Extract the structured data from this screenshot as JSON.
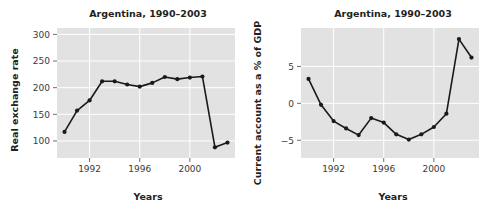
{
  "figure": {
    "title": "",
    "panels": [
      "left",
      "right"
    ]
  },
  "chart_data": [
    {
      "id": "real-exchange-rate",
      "type": "line",
      "title": "Argentina, 1990–2003",
      "xlabel": "Years",
      "ylabel": "Real exchange rate",
      "xlim": [
        1989.4,
        2003.6
      ],
      "ylim": [
        68,
        312
      ],
      "xticks": [
        1992,
        1996,
        2000
      ],
      "xticklabels": [
        "1992",
        "1996",
        "2000"
      ],
      "yticks": [
        100,
        150,
        200,
        250,
        300
      ],
      "yticklabels": [
        "100",
        "150",
        "200",
        "250",
        "300"
      ],
      "grid": true,
      "legend": "none",
      "x": [
        1990,
        1991,
        1992,
        1993,
        1994,
        1995,
        1996,
        1997,
        1998,
        1999,
        2000,
        2001,
        2002,
        2003
      ],
      "values": [
        117,
        157,
        176,
        212,
        212,
        206,
        202,
        209,
        220,
        216,
        219,
        221,
        88,
        97
      ],
      "series": [
        {
          "name": "Real exchange rate",
          "values": [
            117,
            157,
            176,
            212,
            212,
            206,
            202,
            209,
            220,
            216,
            219,
            221,
            88,
            97
          ]
        }
      ]
    },
    {
      "id": "current-account-pct-gdp",
      "type": "line",
      "title": "Argentina, 1990–2003",
      "xlabel": "Years",
      "ylabel": "Current account as a % of GDP",
      "xlim": [
        1989.4,
        2003.6
      ],
      "ylim": [
        -7.4,
        10.2
      ],
      "xticks": [
        1992,
        1996,
        2000
      ],
      "xticklabels": [
        "1992",
        "1996",
        "2000"
      ],
      "yticks": [
        -5,
        0,
        5
      ],
      "yticklabels": [
        "−5",
        "0",
        "5"
      ],
      "grid": true,
      "legend": "none",
      "x": [
        1990,
        1991,
        1992,
        1993,
        1994,
        1995,
        1996,
        1997,
        1998,
        1999,
        2000,
        2001,
        2002,
        2003
      ],
      "values": [
        3.3,
        -0.2,
        -2.4,
        -3.4,
        -4.3,
        -2.0,
        -2.6,
        -4.2,
        -4.9,
        -4.2,
        -3.2,
        -1.4,
        8.7,
        6.2
      ],
      "series": [
        {
          "name": "Current account as a % of GDP",
          "values": [
            3.3,
            -0.2,
            -2.4,
            -3.4,
            -4.3,
            -2.0,
            -2.6,
            -4.2,
            -4.9,
            -4.2,
            -3.2,
            -1.4,
            8.7,
            6.2
          ]
        }
      ]
    }
  ]
}
